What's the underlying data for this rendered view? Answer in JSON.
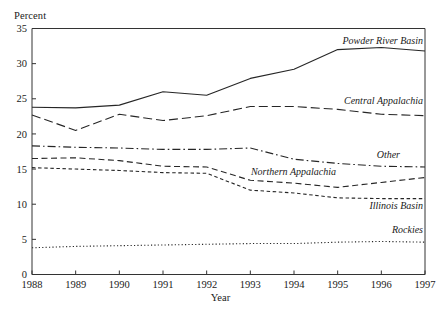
{
  "figure": {
    "y_axis_caption": "Percent",
    "x_axis_caption": "Year"
  },
  "chart_data": {
    "type": "line",
    "title": "",
    "subtitle": "",
    "xlabel": "Year",
    "ylabel": "Percent",
    "x": [
      1988,
      1989,
      1990,
      1991,
      1992,
      1993,
      1994,
      1995,
      1996,
      1997
    ],
    "categories": [
      "1988",
      "1989",
      "1990",
      "1991",
      "1992",
      "1993",
      "1994",
      "1995",
      "1996",
      "1997"
    ],
    "xtick_labels": [
      "1988",
      "1989",
      "1990",
      "1991",
      "1992",
      "1993",
      "1994",
      "1995",
      "1996",
      "1997"
    ],
    "ytick_labels": [
      "0",
      "5",
      "10",
      "15",
      "20",
      "25",
      "30",
      "35"
    ],
    "yticks": [
      0,
      5,
      10,
      15,
      20,
      25,
      30,
      35
    ],
    "ylim": [
      0,
      35
    ],
    "xlim": [
      1988,
      1997
    ],
    "grid": false,
    "legend_position": "inline-right-of-series",
    "series": [
      {
        "name": "Powder River Basin",
        "style": "solid",
        "values": [
          23.8,
          23.7,
          24.1,
          26.0,
          25.5,
          27.9,
          29.2,
          32.0,
          32.3,
          31.8
        ]
      },
      {
        "name": "Central Appalachia",
        "style": "long-dash",
        "values": [
          22.7,
          20.5,
          22.8,
          21.9,
          22.6,
          23.9,
          23.9,
          23.5,
          22.8,
          22.6
        ]
      },
      {
        "name": "Other",
        "style": "dash-dot",
        "values": [
          18.3,
          18.1,
          18.0,
          17.8,
          17.8,
          18.0,
          16.4,
          15.8,
          15.4,
          15.3
        ]
      },
      {
        "name": "Northern Appalachia",
        "style": "medium-dash",
        "values": [
          16.5,
          16.6,
          16.2,
          15.4,
          15.3,
          13.4,
          13.0,
          12.4,
          13.1,
          13.8
        ]
      },
      {
        "name": "Illinois Basin",
        "style": "short-dash",
        "values": [
          15.2,
          15.0,
          14.8,
          14.5,
          14.4,
          12.0,
          11.6,
          10.9,
          10.8,
          10.8
        ]
      },
      {
        "name": "Rockies",
        "style": "dotted",
        "values": [
          3.8,
          4.0,
          4.1,
          4.2,
          4.3,
          4.4,
          4.4,
          4.6,
          4.7,
          4.6
        ]
      }
    ],
    "series_label_anchors": [
      {
        "name": "Powder River Basin",
        "x_px": 423,
        "y_px": 44
      },
      {
        "name": "Central Appalachia",
        "x_px": 423,
        "y_px": 104
      },
      {
        "name": "Other",
        "x_px": 400,
        "y_px": 158
      },
      {
        "name": "Northern Appalachia",
        "x_px": 336,
        "y_px": 175
      },
      {
        "name": "Illinois Basin",
        "x_px": 423,
        "y_px": 209
      },
      {
        "name": "Rockies",
        "x_px": 423,
        "y_px": 233
      }
    ],
    "colors": {
      "line": "#262626",
      "axis": "#333333",
      "background": "#ffffff"
    }
  }
}
